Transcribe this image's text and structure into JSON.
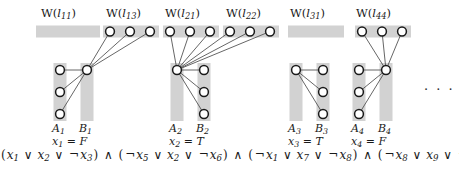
{
  "figure": {
    "title": "",
    "colors": {
      "bar": "#d2d2d2",
      "node_fill": "#ffffff",
      "node_stroke": "#1a1a1a",
      "edge": "#555555",
      "text": "#1a1a1a"
    },
    "ellipsis": "· · ·"
  },
  "clause_groups": [
    {
      "id": "group-1",
      "w_label": {
        "prefix": "W(",
        "var": "l",
        "sub": "11",
        "suffix": ")"
      },
      "w_label_text": "W(l11)",
      "w_nodes": 0,
      "a_label": {
        "var": "A",
        "sub": "1"
      },
      "a_label_text": "A1",
      "b_label": {
        "var": "B",
        "sub": "1"
      },
      "b_label_text": "B1",
      "a_nodes": 3,
      "b_nodes": 1,
      "hub_side": "B",
      "assignment": {
        "var": "x",
        "sub": "1",
        "eq": "=",
        "value": "F"
      },
      "assignment_text": "x1 = F"
    },
    {
      "id": "group-2",
      "w_label": {
        "prefix": "W(",
        "var": "l",
        "sub": "13",
        "suffix": ")"
      },
      "w_label_text": "W(l13)",
      "w_nodes": 3,
      "a_label": null,
      "b_label": null,
      "a_label_text": "",
      "b_label_text": "",
      "a_nodes": 0,
      "b_nodes": 0,
      "hub_side": null,
      "assignment": null,
      "assignment_text": ""
    },
    {
      "id": "group-3",
      "w_label": {
        "prefix": "W(",
        "var": "l",
        "sub": "21",
        "suffix": ")"
      },
      "w_label_text": "W(l21)",
      "w_nodes": 3,
      "a_label": {
        "var": "A",
        "sub": "2"
      },
      "a_label_text": "A2",
      "b_label": {
        "var": "B",
        "sub": "2"
      },
      "b_label_text": "B2",
      "a_nodes": 1,
      "b_nodes": 3,
      "hub_side": "A",
      "assignment": {
        "var": "x",
        "sub": "2",
        "eq": "=",
        "value": "T"
      },
      "assignment_text": "x2 = T"
    },
    {
      "id": "group-4",
      "w_label": {
        "prefix": "W(",
        "var": "l",
        "sub": "22",
        "suffix": ")"
      },
      "w_label_text": "W(l22)",
      "w_nodes": 3,
      "a_label": null,
      "b_label": null,
      "a_label_text": "",
      "b_label_text": "",
      "a_nodes": 0,
      "b_nodes": 0,
      "hub_side": null,
      "assignment": null,
      "assignment_text": ""
    },
    {
      "id": "group-5",
      "w_label": {
        "prefix": "W(",
        "var": "l",
        "sub": "31",
        "suffix": ")"
      },
      "w_label_text": "W(l31)",
      "w_nodes": 0,
      "a_label": {
        "var": "A",
        "sub": "3"
      },
      "a_label_text": "A3",
      "b_label": {
        "var": "B",
        "sub": "3"
      },
      "b_label_text": "B3",
      "a_nodes": 1,
      "b_nodes": 3,
      "hub_side": "A",
      "assignment": {
        "var": "x",
        "sub": "3",
        "eq": "=",
        "value": "T"
      },
      "assignment_text": "x3 = T"
    },
    {
      "id": "group-6",
      "w_label": {
        "prefix": "W(",
        "var": "l",
        "sub": "44",
        "suffix": ")"
      },
      "w_label_text": "W(l44)",
      "w_nodes": 3,
      "a_label": {
        "var": "A",
        "sub": "4"
      },
      "a_label_text": "A4",
      "b_label": {
        "var": "B",
        "sub": "4"
      },
      "b_label_text": "B4",
      "a_nodes": 3,
      "b_nodes": 1,
      "hub_side": "B",
      "assignment": {
        "var": "x",
        "sub": "4",
        "eq": "=",
        "value": "F"
      },
      "assignment_text": "x4 = F"
    }
  ],
  "formula": {
    "text": "(x1 ∨ x2 ∨ ¬x3) ∧ (¬x5 ∨ x2 ∨ ¬x6) ∧ (¬x1 ∨ x7 ∨ ¬x8) ∧ (¬x8 ∨ x9 ∨ ¬x4)",
    "clauses": [
      {
        "literals": [
          {
            "neg": false,
            "var": "x",
            "sub": "1"
          },
          {
            "neg": false,
            "var": "x",
            "sub": "2"
          },
          {
            "neg": true,
            "var": "x",
            "sub": "3"
          }
        ]
      },
      {
        "literals": [
          {
            "neg": true,
            "var": "x",
            "sub": "5"
          },
          {
            "neg": false,
            "var": "x",
            "sub": "2"
          },
          {
            "neg": true,
            "var": "x",
            "sub": "6"
          }
        ]
      },
      {
        "literals": [
          {
            "neg": true,
            "var": "x",
            "sub": "1"
          },
          {
            "neg": false,
            "var": "x",
            "sub": "7"
          },
          {
            "neg": true,
            "var": "x",
            "sub": "8"
          }
        ]
      },
      {
        "literals": [
          {
            "neg": true,
            "var": "x",
            "sub": "8"
          },
          {
            "neg": false,
            "var": "x",
            "sub": "9"
          },
          {
            "neg": true,
            "var": "x",
            "sub": "4"
          }
        ]
      }
    ],
    "or_symbol": "∨",
    "and_symbol": "∧",
    "not_symbol": "¬"
  }
}
